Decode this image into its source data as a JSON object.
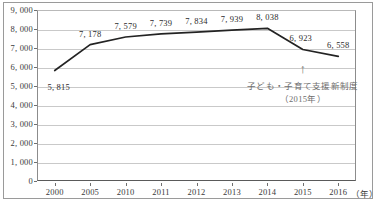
{
  "chart_data": {
    "type": "line",
    "title": "",
    "xlabel": "（年）",
    "ylabel": "",
    "categories": [
      "2000",
      "2005",
      "2010",
      "2011",
      "2012",
      "2013",
      "2014",
      "2015",
      "2016"
    ],
    "values": [
      5815,
      7178,
      7579,
      7739,
      7834,
      7939,
      8038,
      6923,
      6558
    ],
    "point_labels": [
      "5,815",
      "7,178",
      "7,579",
      "7,739",
      "7,834",
      "7,939",
      "8,038",
      "6,923",
      "6,558"
    ],
    "ylim": [
      0,
      9000
    ],
    "ytick_step": 1000,
    "ytick_labels": [
      "9,000",
      "8,000",
      "7,000",
      "6,000",
      "5,000",
      "4,000",
      "3,000",
      "2,000",
      "1,000",
      "0"
    ],
    "ytick_values": [
      9000,
      8000,
      7000,
      6000,
      5000,
      4000,
      3000,
      2000,
      1000,
      0
    ],
    "grid": true,
    "legend": "none",
    "series_color": "#232323",
    "grid_color": "#c9c9c9",
    "annotations": [
      {
        "at_category": "2015",
        "arrow_glyph": "↑",
        "line1": "子ども・子育て支援新制度",
        "line2": "（2015年）",
        "color": "#6e6e6e"
      }
    ]
  },
  "axis": {
    "unit_suffix": "（年）"
  }
}
